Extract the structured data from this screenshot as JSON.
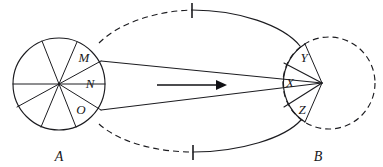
{
  "figure": {
    "kind": "geometric-projection-diagram",
    "width": 383,
    "height": 167,
    "background_color": "#ffffff",
    "ink_color": "#1c1c20"
  },
  "labels": {
    "source_circle": "A",
    "target_circle": "B",
    "source_sectors": [
      "M",
      "N",
      "O"
    ],
    "target_sectors": [
      "Y",
      "X",
      "Z"
    ]
  },
  "source_circle": {
    "name": "A",
    "center_x": 59,
    "center_y": 84,
    "radius": 46,
    "style": "solid",
    "sector_count": 8,
    "label_x": 59,
    "label_y": 160,
    "sector_labels": [
      {
        "text": "M",
        "x": 84,
        "y": 62
      },
      {
        "text": "N",
        "x": 90,
        "y": 88
      },
      {
        "text": "O",
        "x": 81,
        "y": 114
      }
    ]
  },
  "target_circle": {
    "name": "B",
    "center_x": 329,
    "center_y": 83,
    "radius": 46,
    "style": "dashed",
    "label_x": 318,
    "label_y": 160,
    "sector_labels": [
      {
        "text": "Y",
        "x": 304,
        "y": 62
      },
      {
        "text": "X",
        "x": 290,
        "y": 86
      },
      {
        "text": "Z",
        "x": 302,
        "y": 113
      }
    ]
  },
  "convergence_point": {
    "x": 322,
    "y": 83
  },
  "rays": [
    {
      "name": "upper-ray",
      "x1": 101,
      "y1": 61,
      "x2": 322,
      "y2": 83
    },
    {
      "name": "lower-ray",
      "x1": 101,
      "y1": 110,
      "x2": 322,
      "y2": 83
    }
  ],
  "envelope": {
    "upper_curve": {
      "dashed_portion": "left",
      "solid_portion": "right"
    },
    "lower_curve": {
      "dashed_portion": "left",
      "solid_portion": "right"
    }
  },
  "tick_marks": [
    {
      "name": "upper-tick",
      "x": 192,
      "y": 10
    },
    {
      "name": "lower-tick",
      "x": 193,
      "y": 152
    }
  ],
  "direction_arrow": {
    "name": "direction-arrow",
    "from_x": 157,
    "to_x": 226,
    "y": 85,
    "direction": "right"
  }
}
